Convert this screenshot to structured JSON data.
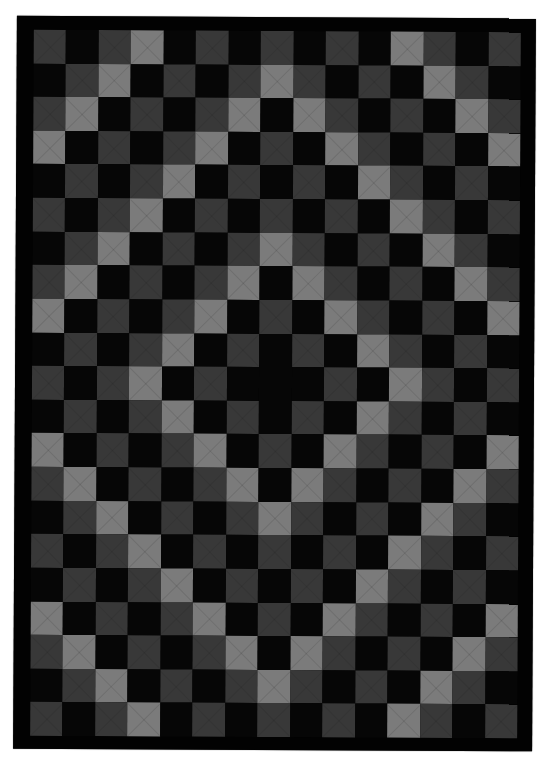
{
  "image": {
    "subject": "Quilt with concentric diamond (Trip Around the World style) pattern of square patches",
    "background_color": "#ffffff"
  },
  "quilt": {
    "border_color": "#020202",
    "columns": 15,
    "rows": 21,
    "center_cell": {
      "row": 10,
      "col": 7
    },
    "palette": {
      "B": {
        "name": "black",
        "hex": "#060606"
      },
      "D": {
        "name": "dark-gray",
        "hex": "#383838"
      },
      "L": {
        "name": "light-gray",
        "hex": "#7b7b7b"
      }
    },
    "grid": [
      "DBDLBDBDBDBLDBD",
      "BDLBDBDLDBDBLDB",
      "DLBDBDLBLDBDBLD",
      "LBDBDLBDBLDBDBL",
      "BDBDLBDBDBLDBDB",
      "DBDLBDBDBDBLDBD",
      "BDLBDBDLDBDBLDB",
      "DLBDBDLBLDBDBLD",
      "LBDBDLBDBLDBDBL",
      "BDBDLBDBDBLDBDB",
      "DBDLBDBBBDBLDBD",
      "BDBDLBDBDBLDBDB",
      "LBDBDLBDBLDBDBL",
      "DLBDBDLBLDBDBLD",
      "BDLBDBDLDBDBLDB",
      "DBDLBDBDBDBLDBD",
      "BDBDLBDBDBLDBDB",
      "LBDBDLBDBLDBDBL",
      "DLBDBDLBLDBDBLD",
      "BDLBDBDLDBDBLDB",
      "DBDLBDBDBDBLDBD"
    ]
  }
}
